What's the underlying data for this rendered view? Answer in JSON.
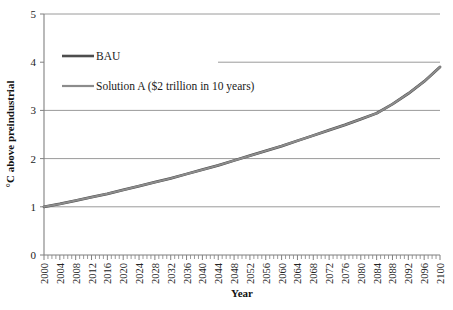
{
  "chart_data": {
    "type": "line",
    "title": "",
    "xlabel": "Year",
    "ylabel": "°C above preindustrial",
    "xlim": [
      2000,
      2100
    ],
    "ylim": [
      0,
      5
    ],
    "yticks": [
      "0",
      "1",
      "2",
      "3",
      "4",
      "5"
    ],
    "grid": true,
    "grid_axis": "y",
    "legend_position": "upper-left-inside",
    "x": [
      2000,
      2004,
      2008,
      2012,
      2016,
      2020,
      2024,
      2028,
      2032,
      2036,
      2040,
      2044,
      2048,
      2052,
      2056,
      2060,
      2064,
      2068,
      2072,
      2076,
      2080,
      2084,
      2088,
      2092,
      2096,
      2100
    ],
    "categories": [
      "2000",
      "2004",
      "2008",
      "2012",
      "2016",
      "2020",
      "2024",
      "2028",
      "2032",
      "2036",
      "2040",
      "2044",
      "2048",
      "2052",
      "2056",
      "2060",
      "2064",
      "2068",
      "2072",
      "2076",
      "2080",
      "2084",
      "2088",
      "2092",
      "2096",
      "2100"
    ],
    "series": [
      {
        "name": "BAU",
        "color": "#4d4d4d",
        "values": [
          1.0,
          1.06,
          1.13,
          1.2,
          1.27,
          1.35,
          1.43,
          1.51,
          1.59,
          1.68,
          1.77,
          1.86,
          1.96,
          2.06,
          2.16,
          2.26,
          2.37,
          2.48,
          2.59,
          2.7,
          2.82,
          2.94,
          3.13,
          3.35,
          3.6,
          3.9
        ]
      },
      {
        "name": "Solution A ($2 trillion in 10 years)",
        "color": "#8c8c8c",
        "values": [
          1.0,
          1.06,
          1.13,
          1.2,
          1.27,
          1.35,
          1.43,
          1.51,
          1.59,
          1.68,
          1.77,
          1.86,
          1.96,
          2.06,
          2.16,
          2.26,
          2.37,
          2.48,
          2.59,
          2.7,
          2.82,
          2.94,
          3.13,
          3.35,
          3.6,
          3.9
        ]
      }
    ]
  },
  "legend": {
    "entries": [
      {
        "label": "BAU",
        "color": "#4d4d4d"
      },
      {
        "label": "Solution A ($2 trillion in 10 years)",
        "color": "#8c8c8c"
      }
    ]
  },
  "axes": {
    "y_title": "°C above preindustrial",
    "x_title": "Year",
    "y_tick_0": "0",
    "y_tick_1": "1",
    "y_tick_2": "2",
    "y_tick_3": "3",
    "y_tick_4": "4",
    "y_tick_5": "5"
  },
  "colors": {
    "axis": "#808080",
    "grid": "#9a9a9a",
    "bau": "#4d4d4d",
    "solution_a": "#8c8c8c",
    "text": "#1a1a1a",
    "background": "#ffffff"
  }
}
